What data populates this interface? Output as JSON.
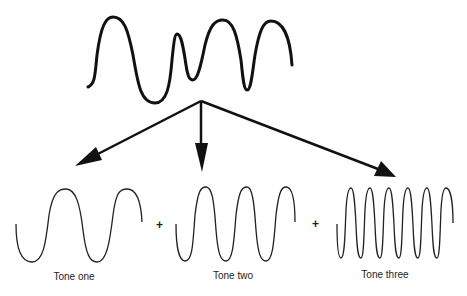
{
  "diagram": {
    "composite_wave": {
      "name": "complex-wave"
    },
    "components": [
      {
        "label": "Tone one",
        "cycles": 2
      },
      {
        "label": "Tone two",
        "cycles": 3
      },
      {
        "label": "Tone three",
        "cycles": 6
      }
    ],
    "operators": [
      "+",
      "+"
    ],
    "colors": {
      "stroke": "#111111",
      "background": "#ffffff"
    }
  }
}
